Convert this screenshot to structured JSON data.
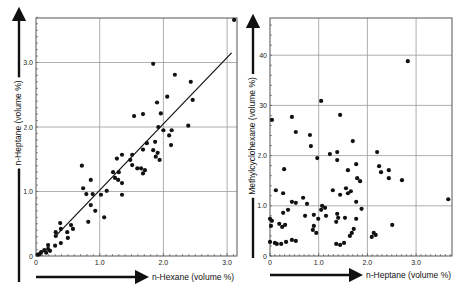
{
  "chart_data": [
    {
      "type": "scatter",
      "title": "",
      "xlabel": "n-Hexane (volume %)",
      "ylabel": "n-Heptane (volume %)",
      "xlim": [
        0,
        3.15
      ],
      "ylim": [
        0,
        3.7
      ],
      "xticks": [
        0,
        1.0,
        2.0,
        3.0
      ],
      "yticks": [
        0,
        1.0,
        2.0,
        3.0
      ],
      "xtick_labels": [
        "0",
        "1.0",
        "2.0",
        "3.0"
      ],
      "ytick_labels": [
        "0",
        "1.0",
        "2.0",
        "3.0"
      ],
      "grid": true,
      "legend": null,
      "regression_line": {
        "x": [
          0.3,
          3.07
        ],
        "y": [
          0.3,
          3.15
        ]
      },
      "x": [
        3.11,
        1.84,
        2.18,
        2.43,
        2.06,
        2.46,
        1.9,
        1.68,
        1.96,
        1.54,
        2.39,
        1.92,
        2.0,
        2.13,
        2.09,
        1.74,
        1.87,
        2.12,
        1.68,
        1.84,
        1.91,
        1.88,
        1.94,
        1.35,
        1.51,
        1.27,
        1.48,
        1.51,
        1.59,
        1.65,
        1.71,
        1.68,
        1.21,
        1.3,
        1.24,
        1.29,
        1.35,
        1.35,
        1.11,
        1.02,
        0.72,
        0.74,
        0.79,
        0.86,
        0.89,
        0.86,
        0.93,
        0.82,
        1.07,
        0.38,
        0.39,
        0.31,
        0.31,
        0.39,
        0.5,
        0.55,
        0.58,
        0.49,
        0.3,
        0.19,
        0.19,
        0.13,
        0.16,
        0.06,
        0.03,
        0.08,
        0.22
      ],
      "y": [
        3.66,
        2.98,
        2.81,
        2.7,
        2.47,
        2.42,
        2.38,
        2.2,
        2.21,
        2.17,
        2.02,
        2.0,
        1.95,
        1.95,
        1.87,
        1.75,
        1.77,
        1.72,
        1.65,
        1.64,
        1.6,
        1.54,
        1.49,
        1.57,
        1.57,
        1.51,
        1.49,
        1.41,
        1.36,
        1.36,
        1.33,
        1.28,
        1.3,
        1.3,
        1.21,
        1.18,
        1.13,
        0.95,
        1.01,
        0.95,
        1.4,
        1.05,
        0.96,
        1.18,
        0.96,
        0.79,
        0.7,
        0.53,
        0.6,
        0.51,
        0.42,
        0.37,
        0.31,
        0.2,
        0.28,
        0.48,
        0.42,
        0.37,
        0.16,
        0.17,
        0.11,
        0.09,
        0.05,
        0.03,
        0.02,
        0.06,
        0.08
      ]
    },
    {
      "type": "scatter",
      "title": "",
      "xlabel": "n-Heptane (volume %)",
      "ylabel": "Methylcyclohexane (volume %)",
      "xlim": [
        0,
        3.75
      ],
      "ylim": [
        0,
        47.5
      ],
      "xticks": [
        0,
        1.0,
        2.0,
        3.0
      ],
      "yticks": [
        0,
        10,
        20,
        30,
        40
      ],
      "xtick_labels": [
        "0",
        "1.0",
        "2.0",
        "3.0"
      ],
      "ytick_labels": [
        "0",
        "1.0",
        "2.0",
        "30",
        "40"
      ],
      "grid": true,
      "legend": null,
      "x": [
        2.83,
        0.04,
        0.45,
        0.53,
        0.82,
        0.84,
        1.05,
        1.44,
        1.7,
        0.97,
        1.23,
        1.38,
        1.38,
        1.6,
        1.77,
        1.79,
        1.85,
        2.2,
        2.24,
        2.28,
        2.44,
        2.44,
        2.71,
        3.66,
        0.29,
        0.12,
        0.27,
        0.68,
        0.76,
        0.45,
        0.53,
        1.07,
        1.13,
        1.05,
        1.29,
        1.56,
        1.66,
        1.6,
        1.44,
        1.77,
        1.88,
        0.72,
        0.9,
        1.38,
        1.4,
        1.36,
        1.54,
        1.15,
        0.99,
        1.77,
        0.27,
        0.37,
        0.0,
        0.04,
        0.19,
        0.31,
        0.25,
        0.02,
        1.72,
        1.68,
        1.64,
        0.9,
        0.88,
        0.95,
        2.13,
        2.17,
        2.09,
        2.51,
        0.0,
        0.1,
        0.23,
        0.33,
        0.45,
        0.53,
        1.36,
        1.44,
        1.52,
        0.14
      ],
      "y": [
        38.8,
        27.1,
        27.7,
        24.7,
        24.1,
        21.9,
        30.9,
        28.1,
        22.9,
        19.5,
        20.3,
        20.7,
        19.1,
        17.1,
        18.3,
        15.5,
        14.9,
        20.7,
        17.9,
        16.7,
        17.1,
        15.5,
        15.1,
        11.3,
        17.3,
        13.1,
        12.5,
        11.6,
        10.4,
        10.8,
        10.6,
        10.0,
        9.6,
        9.2,
        13.1,
        13.5,
        12.9,
        12.5,
        12.2,
        10.8,
        9.4,
        8.0,
        8.2,
        8.4,
        7.6,
        6.8,
        7.6,
        8.0,
        7.4,
        7.4,
        8.6,
        9.2,
        7.4,
        7.0,
        6.4,
        6.2,
        5.8,
        6.0,
        5.4,
        4.6,
        4.0,
        6.0,
        5.2,
        4.6,
        4.6,
        4.2,
        3.8,
        6.2,
        2.8,
        2.6,
        2.4,
        2.8,
        3.2,
        3.0,
        2.4,
        2.2,
        2.6,
        2.4
      ]
    }
  ],
  "panels": [
    {
      "frame": {
        "left": 36,
        "top": 18,
        "right": 237,
        "bottom": 256
      },
      "xscale": {
        "origin_px": 36,
        "px_per_unit": 63.7
      },
      "yscale": {
        "origin_px": 256,
        "px_per_unit": 64.5
      },
      "arrows": {
        "y": {
          "x": 19,
          "y1": 282,
          "y2": 8
        },
        "x": {
          "y": 277,
          "x1": 36,
          "x2": 148
        }
      },
      "ylabel_pos": {
        "x": 19,
        "y": 123
      },
      "xlabel_pos": {
        "x": 152,
        "y": 280
      }
    },
    {
      "frame": {
        "left": 270,
        "top": 18,
        "right": 452,
        "bottom": 256
      },
      "xscale": {
        "origin_px": 270,
        "px_per_unit": 48.7
      },
      "yscale": {
        "origin_px": 256,
        "px_per_unit": 5.02
      },
      "arrows": {
        "y": {
          "x": 253,
          "y1": 258,
          "y2": 15
        },
        "x": {
          "y": 275,
          "x1": 270,
          "x2": 362
        }
      },
      "ylabel_pos": {
        "x": 253,
        "y": 136
      },
      "xlabel_pos": {
        "x": 366,
        "y": 278
      }
    }
  ]
}
